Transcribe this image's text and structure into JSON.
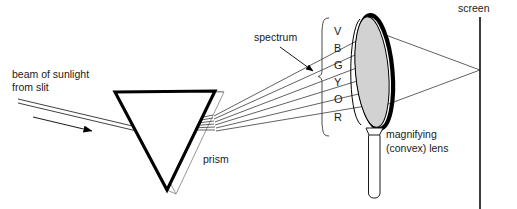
{
  "diagram": {
    "background_color": "#ffffff",
    "ink_color": "#1a1a1a",
    "width": 517,
    "height": 209
  },
  "labels": {
    "beam_line1": "beam of sunlight",
    "beam_line2": "from slit",
    "prism": "prism",
    "spectrum": "spectrum",
    "lens_line1": "magnifying",
    "lens_line2": "(convex) lens",
    "screen": "screen"
  },
  "spectrum": {
    "letters": [
      "V",
      "B",
      "G",
      "Y",
      "O",
      "R"
    ],
    "names": [
      "violet",
      "blue",
      "green",
      "yellow",
      "orange",
      "red"
    ],
    "ray_count": 6
  },
  "components": {
    "prism": {
      "name": "prism",
      "shape": "inverted-triangle",
      "fill": "#ffffff",
      "outline": "#000000"
    },
    "lens": {
      "name": "magnifying convex lens",
      "shape": "ellipse",
      "fill": "#d2d2d2",
      "rim": "#000000"
    },
    "screen": {
      "name": "screen",
      "shape": "vertical-line",
      "color": "#1a1a1a"
    }
  }
}
